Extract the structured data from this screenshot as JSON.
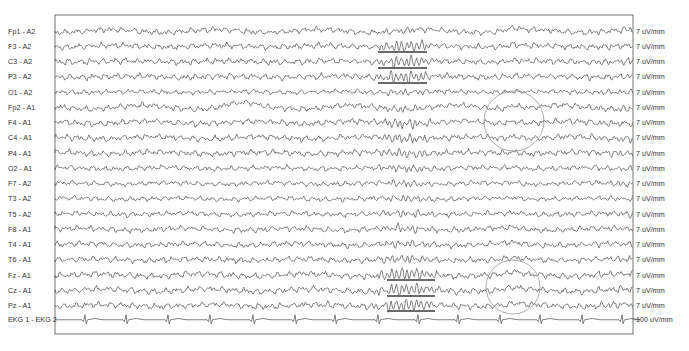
{
  "chart_data": {
    "type": "line",
    "title": "",
    "xlabel": "",
    "ylabel": "",
    "grid": false,
    "frame": {
      "left": 55,
      "top": 15,
      "right": 633,
      "bottom": 334
    },
    "row_top": 31,
    "row_spacing": 15.25,
    "channels": [
      {
        "label": "Fp1 - A2",
        "scale": "7 uV/mm",
        "seed": 11,
        "amp": 2.6,
        "burst": 0.5,
        "slow": 1.2
      },
      {
        "label": "F3 - A2",
        "scale": "7 uV/mm",
        "seed": 12,
        "amp": 2.8,
        "burst": 1.6,
        "slow": 0.6
      },
      {
        "label": "C3 - A2",
        "scale": "7 uV/mm",
        "seed": 13,
        "amp": 2.8,
        "burst": 1.7,
        "slow": 0.5
      },
      {
        "label": "P3 - A2",
        "scale": "7 uV/mm",
        "seed": 14,
        "amp": 2.8,
        "burst": 1.6,
        "slow": 0.5
      },
      {
        "label": "O1 - A2",
        "scale": "7 uV/mm",
        "seed": 15,
        "amp": 2.2,
        "burst": 0.6,
        "slow": 0.4
      },
      {
        "label": "Fp2 - A1",
        "scale": "7 uV/mm",
        "seed": 16,
        "amp": 2.6,
        "burst": 0.6,
        "slow": 1.6
      },
      {
        "label": "F4 - A1",
        "scale": "7 uV/mm",
        "seed": 17,
        "amp": 2.8,
        "burst": 1.2,
        "slow": 1.0
      },
      {
        "label": "C4 - A1",
        "scale": "7 uV/mm",
        "seed": 18,
        "amp": 2.8,
        "burst": 1.2,
        "slow": 0.9
      },
      {
        "label": "P4 - A1",
        "scale": "7 uV/mm",
        "seed": 19,
        "amp": 2.8,
        "burst": 1.0,
        "slow": 0.7
      },
      {
        "label": "O2 - A1",
        "scale": "7 uV/mm",
        "seed": 20,
        "amp": 2.4,
        "burst": 0.8,
        "slow": 0.5
      },
      {
        "label": "F7 - A2",
        "scale": "7 uV/mm",
        "seed": 21,
        "amp": 2.3,
        "burst": 0.7,
        "slow": 0.6
      },
      {
        "label": "T3 - A2",
        "scale": "7 uV/mm",
        "seed": 22,
        "amp": 2.3,
        "burst": 0.7,
        "slow": 0.5
      },
      {
        "label": "T5 - A2",
        "scale": "7 uV/mm",
        "seed": 23,
        "amp": 2.4,
        "burst": 0.8,
        "slow": 0.5
      },
      {
        "label": "F8 - A1",
        "scale": "7 uV/mm",
        "seed": 24,
        "amp": 2.6,
        "burst": 0.8,
        "slow": 0.8
      },
      {
        "label": "T4 - A1",
        "scale": "7 uV/mm",
        "seed": 25,
        "amp": 2.6,
        "burst": 0.8,
        "slow": 0.7
      },
      {
        "label": "T6 - A1",
        "scale": "7 uV/mm",
        "seed": 26,
        "amp": 2.7,
        "burst": 1.0,
        "slow": 0.6
      },
      {
        "label": "Fz - A1",
        "scale": "7 uV/mm",
        "seed": 27,
        "amp": 2.9,
        "burst": 1.8,
        "slow": 1.0
      },
      {
        "label": "Cz - A1",
        "scale": "7 uV/mm",
        "seed": 28,
        "amp": 2.9,
        "burst": 1.8,
        "slow": 1.0
      },
      {
        "label": "Pz - A1",
        "scale": "7 uV/mm",
        "seed": 29,
        "amp": 2.9,
        "burst": 1.8,
        "slow": 0.8
      }
    ],
    "ekg": {
      "label": "EKG 1 - EKG 2",
      "scale": "100 uV/mm",
      "qrs_x": [
        85,
        126,
        168,
        210,
        253,
        295,
        335,
        378,
        418,
        458,
        500,
        540,
        582,
        622
      ]
    },
    "burst_window_x": [
      370,
      440
    ],
    "sharp_wave_x": 514,
    "annotations": {
      "underlines": [
        {
          "x1": 378,
          "x2": 427,
          "y": 52
        },
        {
          "x1": 378,
          "x2": 427,
          "y": 68
        },
        {
          "x1": 378,
          "x2": 427,
          "y": 83
        },
        {
          "x1": 387,
          "x2": 435,
          "y": 280
        },
        {
          "x1": 387,
          "x2": 435,
          "y": 296
        },
        {
          "x1": 387,
          "x2": 435,
          "y": 311
        }
      ],
      "circles": [
        {
          "cx": 514,
          "cy": 121,
          "r": 30
        },
        {
          "cx": 513,
          "cy": 287,
          "r": 27
        }
      ]
    }
  }
}
